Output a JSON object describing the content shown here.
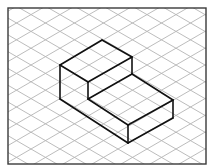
{
  "diagram": {
    "type": "isometric-drawing",
    "canvas": {
      "width": 212,
      "height": 168
    },
    "frame": {
      "x": 8,
      "y": 8,
      "width": 198,
      "height": 156,
      "color": "#3a3a3a"
    },
    "grid": {
      "color": "#b4b4b4",
      "origin": [
        60,
        65
      ],
      "step_x": 14.5,
      "step_y": 8.4,
      "line_spacing_vertical": 16.8
    },
    "shape": {
      "color": "#111111",
      "vertices": {
        "A": [
          102,
          40
        ],
        "B": [
          60,
          65
        ],
        "C": [
          88,
          82
        ],
        "D": [
          132,
          57
        ],
        "E": [
          132,
          74
        ],
        "F": [
          88,
          99
        ],
        "G": [
          173,
          100
        ],
        "H": [
          128,
          125
        ],
        "I": [
          60,
          99
        ],
        "J": [
          128,
          143
        ],
        "K": [
          173,
          118
        ]
      },
      "edges": [
        [
          "A",
          "B"
        ],
        [
          "B",
          "C"
        ],
        [
          "C",
          "D"
        ],
        [
          "D",
          "A"
        ],
        [
          "D",
          "E"
        ],
        [
          "C",
          "F"
        ],
        [
          "E",
          "F"
        ],
        [
          "E",
          "G"
        ],
        [
          "F",
          "H"
        ],
        [
          "H",
          "G"
        ],
        [
          "B",
          "I"
        ],
        [
          "I",
          "J"
        ],
        [
          "H",
          "J"
        ],
        [
          "G",
          "K"
        ],
        [
          "J",
          "K"
        ]
      ]
    }
  }
}
